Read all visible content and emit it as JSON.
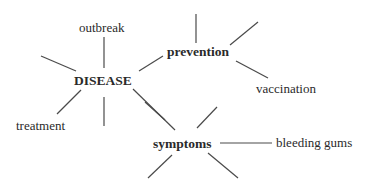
{
  "diagram": {
    "type": "word-web",
    "colors": {
      "line": "#4a4a4a",
      "text": "#2a2a2a",
      "background": "#ffffff"
    },
    "nodes": [
      {
        "id": "disease",
        "label": "DISEASE",
        "bold": true,
        "x": 74,
        "y": 74
      },
      {
        "id": "outbreak",
        "label": "outbreak",
        "bold": false,
        "x": 79,
        "y": 21
      },
      {
        "id": "prevention",
        "label": "prevention",
        "bold": true,
        "x": 167,
        "y": 45
      },
      {
        "id": "vaccination",
        "label": "vaccination",
        "bold": false,
        "x": 256,
        "y": 82
      },
      {
        "id": "treatment",
        "label": "treatment",
        "bold": false,
        "x": 16,
        "y": 119
      },
      {
        "id": "symptoms",
        "label": "symptoms",
        "bold": true,
        "x": 153,
        "y": 137
      },
      {
        "id": "bleeding_gums",
        "label": "bleeding gums",
        "bold": false,
        "x": 276,
        "y": 136
      }
    ],
    "edges": [
      {
        "x1": 104,
        "y1": 37,
        "x2": 104,
        "y2": 68
      },
      {
        "x1": 41,
        "y1": 56,
        "x2": 76,
        "y2": 71
      },
      {
        "x1": 139,
        "y1": 71,
        "x2": 163,
        "y2": 56
      },
      {
        "x1": 81,
        "y1": 90,
        "x2": 57,
        "y2": 114
      },
      {
        "x1": 104,
        "y1": 97,
        "x2": 104,
        "y2": 126
      },
      {
        "x1": 133,
        "y1": 89,
        "x2": 175,
        "y2": 130
      },
      {
        "x1": 196,
        "y1": 14,
        "x2": 196,
        "y2": 43
      },
      {
        "x1": 230,
        "y1": 45,
        "x2": 258,
        "y2": 22
      },
      {
        "x1": 236,
        "y1": 61,
        "x2": 268,
        "y2": 78
      },
      {
        "x1": 145,
        "y1": 102,
        "x2": 165,
        "y2": 120
      },
      {
        "x1": 217,
        "y1": 107,
        "x2": 197,
        "y2": 128
      },
      {
        "x1": 220,
        "y1": 143,
        "x2": 272,
        "y2": 143
      },
      {
        "x1": 172,
        "y1": 155,
        "x2": 148,
        "y2": 178
      },
      {
        "x1": 208,
        "y1": 153,
        "x2": 238,
        "y2": 178
      }
    ]
  }
}
